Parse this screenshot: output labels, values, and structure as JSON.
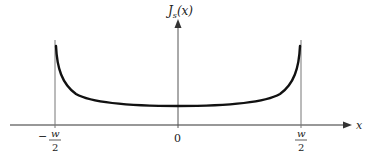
{
  "diagram": {
    "y_axis_label_main": "J",
    "y_axis_label_sub": "s",
    "y_axis_label_arg": "(x)",
    "x_axis_label": "x",
    "ticks": {
      "left": {
        "sign": "−",
        "num": "w",
        "den": "2"
      },
      "center": "0",
      "right": {
        "num": "w",
        "den": "2"
      }
    },
    "colors": {
      "curve": "#111111",
      "axis": "#333333",
      "guide": "#777777",
      "background": "#ffffff"
    },
    "curve_description": "Current density distribution J_s(x) across strip width, minimum at center, diverging at edges x = ±w/2"
  }
}
